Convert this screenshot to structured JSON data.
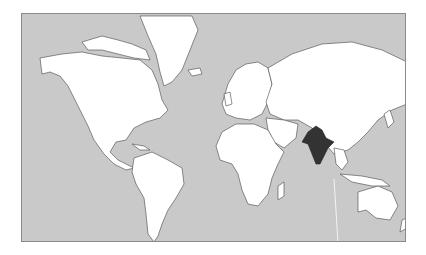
{
  "map": {
    "projection": "mercator",
    "colors": {
      "ocean": "#c9c9c9",
      "land": "#ffffff",
      "border": "#444444",
      "highlight": "#333333",
      "frame": "#8a8a8a"
    },
    "highlighted_country": "India"
  }
}
